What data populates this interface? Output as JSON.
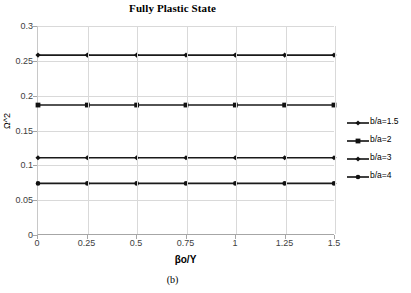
{
  "figure": {
    "caption": "(b)"
  },
  "chart_data": {
    "type": "line",
    "title": "Fully Plastic State",
    "xlabel": "βo/Y",
    "ylabel": "Ω^2",
    "x": [
      0,
      0.25,
      0.5,
      0.75,
      1,
      1.25,
      1.5
    ],
    "xlim": [
      0,
      1.5
    ],
    "ylim": [
      0,
      0.3
    ],
    "xticks": [
      "0",
      "0.25",
      "0.5",
      "0.75",
      "1",
      "1.25",
      "1.5"
    ],
    "yticks": [
      "0",
      "0.05",
      "0.1",
      "0.15",
      "0.2",
      "0.25",
      "0.3"
    ],
    "xtick_values": [
      0,
      0.25,
      0.5,
      0.75,
      1,
      1.25,
      1.5
    ],
    "ytick_values": [
      0,
      0.05,
      0.1,
      0.15,
      0.2,
      0.25,
      0.3
    ],
    "grid": true,
    "legend_position": "right",
    "series": [
      {
        "name": "b/a=1.5",
        "marker": "diamond",
        "color": "#111111",
        "values": [
          0.258,
          0.258,
          0.258,
          0.258,
          0.258,
          0.258,
          0.258
        ]
      },
      {
        "name": "b/a=2",
        "marker": "square",
        "color": "#111111",
        "values": [
          0.186,
          0.186,
          0.186,
          0.186,
          0.186,
          0.186,
          0.186
        ]
      },
      {
        "name": "b/a=3",
        "marker": "diamond",
        "color": "#111111",
        "values": [
          0.11,
          0.11,
          0.11,
          0.11,
          0.11,
          0.11,
          0.11
        ]
      },
      {
        "name": "b/a=4",
        "marker": "dot",
        "color": "#111111",
        "values": [
          0.073,
          0.073,
          0.073,
          0.073,
          0.073,
          0.073,
          0.073
        ]
      }
    ]
  }
}
